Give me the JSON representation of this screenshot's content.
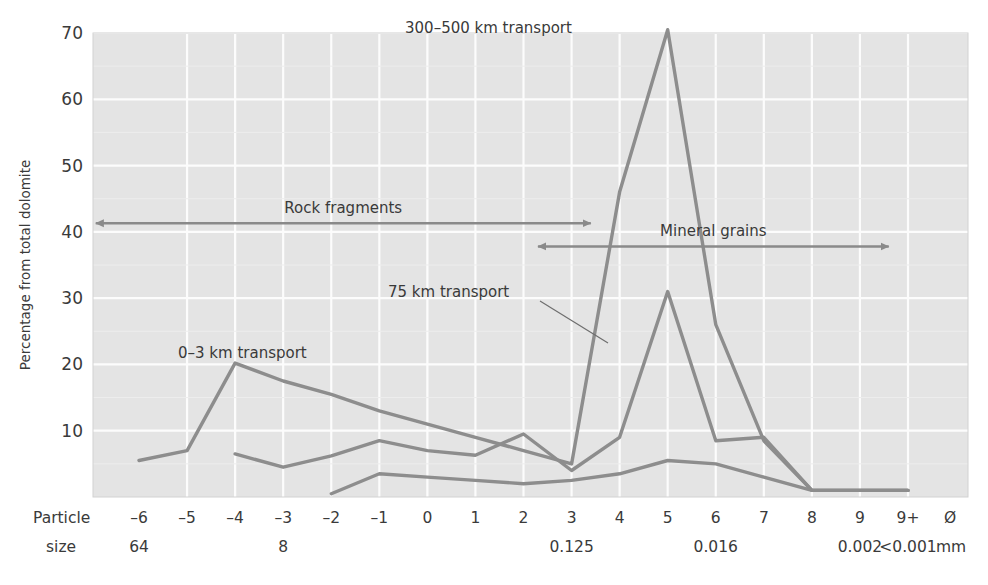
{
  "axes": {
    "y_axis_label": "Percentage from total dolomite",
    "y_ticks": [
      "10",
      "20",
      "30",
      "40",
      "50",
      "60",
      "70"
    ],
    "x_axis_row1_name": "Particle",
    "x_axis_row2_name": "size",
    "x_phi_unit": "Ø",
    "x_mm_unit": "mm",
    "x_ticks": [
      "-6",
      "-5",
      "-4",
      "-3",
      "-2",
      "-1",
      "0",
      "1",
      "2",
      "3",
      "4",
      "5",
      "6",
      "7",
      "8",
      "9",
      "9+"
    ],
    "x_ticks_display": [
      "–6",
      "–5",
      "–4",
      "–3",
      "–2",
      "–1",
      "0",
      "1",
      "2",
      "3",
      "4",
      "5",
      "6",
      "7",
      "8",
      "9",
      "9+"
    ],
    "x_size_labels": [
      {
        "phi": "-6",
        "text": "64"
      },
      {
        "phi": "-3",
        "text": "8"
      },
      {
        "phi": "3",
        "text": "0.125"
      },
      {
        "phi": "6",
        "text": "0.016"
      },
      {
        "phi": "9",
        "text": "0.002"
      },
      {
        "phi": "9+",
        "text": "<0.001"
      }
    ]
  },
  "annotations": {
    "series_label_long": "300–500 km transport",
    "series_label_mid": "75 km transport",
    "series_label_short": "0–3 km transport",
    "arrow_rock": "Rock fragments",
    "arrow_mineral": "Mineral grains"
  },
  "colors": {
    "plot_background": "#e4e4e4",
    "gridline": "#fcfcfc",
    "series_line": "#8d8d8d",
    "annotation_arrow": "#8a8a8a",
    "text": "#3a3a3a",
    "leader_line": "#6e6e6e"
  },
  "chart_data": {
    "type": "line",
    "title": "",
    "xlabel": "Particle size",
    "ylabel": "Percentage from total dolomite",
    "xlim": [
      -6.5,
      9.5
    ],
    "ylim": [
      0,
      70
    ],
    "grid": true,
    "legend": "inline-annotations",
    "x": [
      -6,
      -5,
      -4,
      -3,
      -2,
      -1,
      0,
      1,
      2,
      3,
      4,
      5,
      6,
      7,
      8,
      9,
      "9+"
    ],
    "series": [
      {
        "name": "0–3 km transport",
        "label_position": {
          "phi": -3.1,
          "value": 25
        },
        "values": [
          5.5,
          7.0,
          20.2,
          17.5,
          15.5,
          13.0,
          11.0,
          9.0,
          7.0,
          5.0,
          46.0,
          70.5,
          26.0,
          8.5,
          1.0,
          1.0,
          1.0
        ]
      },
      {
        "name": "75 km transport",
        "label_position": {
          "phi": 1.5,
          "value": 31
        },
        "values": [
          null,
          null,
          6.5,
          4.5,
          6.2,
          8.5,
          7.0,
          6.3,
          9.5,
          4.0,
          9.0,
          31.0,
          8.5,
          9.0,
          1.0,
          1.0,
          1.0
        ]
      },
      {
        "name": "300–500 km transport",
        "label_position": {
          "phi": 2.2,
          "value": 68
        },
        "values": [
          null,
          null,
          null,
          null,
          0.5,
          3.5,
          3.0,
          2.5,
          2.0,
          2.5,
          3.5,
          5.5,
          5.0,
          3.0,
          1.0,
          1.0,
          1.0
        ]
      }
    ],
    "span_annotations": [
      {
        "label": "Rock fragments",
        "from_phi": -6.9,
        "to_phi": 3.4,
        "value": 41.3
      },
      {
        "label": "Mineral grains",
        "from_phi": 2.3,
        "to_phi": 9.6,
        "value": 37.8
      }
    ]
  }
}
